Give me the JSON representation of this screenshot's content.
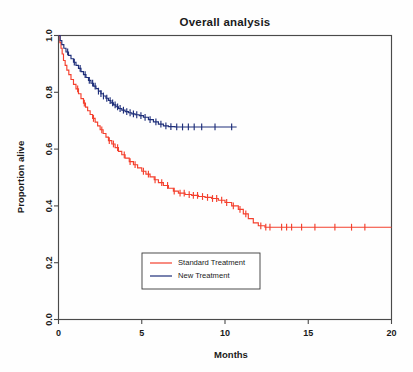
{
  "figure": {
    "title": "Overall analysis",
    "background_color": "#fefefe"
  },
  "chart_data": {
    "type": "line",
    "chart_subtype": "kaplan-meier-survival-curve",
    "title": "Overall analysis",
    "xlabel": "Months",
    "ylabel": "Proportion alive",
    "xlim": [
      0,
      20
    ],
    "ylim": [
      0.0,
      1.0
    ],
    "grid": false,
    "xticks": [
      0,
      5,
      10,
      15,
      20
    ],
    "xtick_labels": [
      "0",
      "5",
      "10",
      "15",
      "20"
    ],
    "yticks": [
      0.0,
      0.2,
      0.4,
      0.6,
      0.8,
      1.0
    ],
    "ytick_labels": [
      "0.0",
      "0.2",
      "0.4",
      "0.6",
      "0.8",
      "1.0"
    ],
    "legend_position": "bottom-center-inside",
    "series": [
      {
        "name": "Standard Treatment",
        "color": "#f4402e",
        "final_value": 0.325,
        "max_followup_months": 20.0,
        "steps": [
          [
            0.0,
            1.0
          ],
          [
            0.08,
            0.975
          ],
          [
            0.15,
            0.955
          ],
          [
            0.22,
            0.935
          ],
          [
            0.3,
            0.912
          ],
          [
            0.4,
            0.895
          ],
          [
            0.5,
            0.878
          ],
          [
            0.62,
            0.862
          ],
          [
            0.75,
            0.845
          ],
          [
            0.9,
            0.828
          ],
          [
            1.05,
            0.812
          ],
          [
            1.2,
            0.795
          ],
          [
            1.35,
            0.778
          ],
          [
            1.5,
            0.762
          ],
          [
            1.62,
            0.748
          ],
          [
            1.75,
            0.735
          ],
          [
            1.9,
            0.722
          ],
          [
            2.05,
            0.708
          ],
          [
            2.2,
            0.695
          ],
          [
            2.35,
            0.682
          ],
          [
            2.5,
            0.668
          ],
          [
            2.68,
            0.655
          ],
          [
            2.85,
            0.642
          ],
          [
            3.0,
            0.63
          ],
          [
            3.2,
            0.618
          ],
          [
            3.4,
            0.605
          ],
          [
            3.6,
            0.592
          ],
          [
            3.8,
            0.58
          ],
          [
            4.0,
            0.568
          ],
          [
            4.25,
            0.556
          ],
          [
            4.5,
            0.545
          ],
          [
            4.75,
            0.534
          ],
          [
            5.0,
            0.522
          ],
          [
            5.25,
            0.512
          ],
          [
            5.5,
            0.502
          ],
          [
            5.75,
            0.492
          ],
          [
            6.0,
            0.482
          ],
          [
            6.3,
            0.472
          ],
          [
            6.6,
            0.462
          ],
          [
            6.9,
            0.452
          ],
          [
            7.2,
            0.445
          ],
          [
            7.6,
            0.44
          ],
          [
            8.0,
            0.437
          ],
          [
            8.4,
            0.433
          ],
          [
            8.8,
            0.43
          ],
          [
            9.2,
            0.426
          ],
          [
            9.6,
            0.42
          ],
          [
            10.0,
            0.412
          ],
          [
            10.4,
            0.4
          ],
          [
            10.8,
            0.388
          ],
          [
            11.1,
            0.372
          ],
          [
            11.4,
            0.355
          ],
          [
            11.7,
            0.34
          ],
          [
            12.0,
            0.33
          ],
          [
            12.4,
            0.325
          ],
          [
            20.0,
            0.325
          ]
        ],
        "censor_times": [
          1.15,
          1.55,
          2.1,
          2.6,
          3.05,
          3.3,
          3.55,
          3.95,
          4.3,
          4.6,
          5.1,
          5.4,
          5.8,
          6.2,
          6.55,
          6.95,
          7.3,
          7.55,
          7.85,
          8.1,
          8.35,
          8.65,
          8.95,
          9.25,
          9.5,
          9.8,
          10.1,
          10.5,
          10.9,
          11.25,
          12.15,
          12.45,
          12.7,
          13.4,
          13.7,
          14.0,
          14.6,
          15.4,
          16.6,
          17.6,
          18.4
        ]
      },
      {
        "name": "New Treatment",
        "color": "#1f2f7a",
        "final_value": 0.678,
        "max_followup_months": 10.7,
        "steps": [
          [
            0.0,
            1.0
          ],
          [
            0.1,
            0.982
          ],
          [
            0.2,
            0.968
          ],
          [
            0.32,
            0.955
          ],
          [
            0.45,
            0.942
          ],
          [
            0.6,
            0.93
          ],
          [
            0.75,
            0.918
          ],
          [
            0.9,
            0.906
          ],
          [
            1.05,
            0.895
          ],
          [
            1.2,
            0.884
          ],
          [
            1.35,
            0.873
          ],
          [
            1.5,
            0.862
          ],
          [
            1.65,
            0.852
          ],
          [
            1.8,
            0.842
          ],
          [
            1.95,
            0.832
          ],
          [
            2.1,
            0.822
          ],
          [
            2.25,
            0.813
          ],
          [
            2.4,
            0.804
          ],
          [
            2.55,
            0.795
          ],
          [
            2.7,
            0.787
          ],
          [
            2.85,
            0.779
          ],
          [
            3.0,
            0.771
          ],
          [
            3.15,
            0.763
          ],
          [
            3.3,
            0.756
          ],
          [
            3.45,
            0.749
          ],
          [
            3.6,
            0.743
          ],
          [
            3.8,
            0.737
          ],
          [
            4.0,
            0.732
          ],
          [
            4.2,
            0.728
          ],
          [
            4.4,
            0.724
          ],
          [
            4.6,
            0.721
          ],
          [
            4.85,
            0.718
          ],
          [
            5.1,
            0.712
          ],
          [
            5.4,
            0.704
          ],
          [
            5.7,
            0.696
          ],
          [
            6.0,
            0.688
          ],
          [
            6.3,
            0.682
          ],
          [
            6.6,
            0.679
          ],
          [
            7.0,
            0.678
          ],
          [
            10.7,
            0.678
          ]
        ],
        "censor_times": [
          0.55,
          0.95,
          1.3,
          1.6,
          1.85,
          2.05,
          2.2,
          2.4,
          2.55,
          2.7,
          2.9,
          3.1,
          3.25,
          3.4,
          3.55,
          3.7,
          3.9,
          4.1,
          4.3,
          4.5,
          4.7,
          4.95,
          5.2,
          5.5,
          5.85,
          6.15,
          6.45,
          6.75,
          7.1,
          7.45,
          7.8,
          8.15,
          8.6,
          9.4,
          10.4
        ]
      }
    ]
  },
  "legend": {
    "entries": [
      {
        "label": "Standard Treatment",
        "color": "#f4402e"
      },
      {
        "label": "New Treatment",
        "color": "#1f2f7a"
      }
    ]
  }
}
